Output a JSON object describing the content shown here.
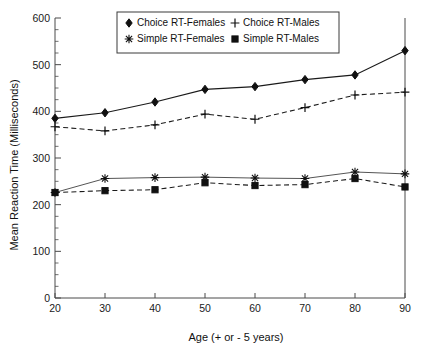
{
  "chart_data": {
    "type": "line",
    "title": "",
    "xlabel": "Age (+ or - 5 years)",
    "ylabel": "Mean Reaction Time (Milliseconds)",
    "x": [
      20,
      30,
      40,
      50,
      60,
      70,
      80,
      90
    ],
    "xtick_labels": [
      "20",
      "30",
      "40",
      "50",
      "60",
      "70",
      "80",
      "90"
    ],
    "ytick_labels": [
      "0",
      "100",
      "200",
      "300",
      "400",
      "500",
      "600"
    ],
    "yticks": [
      0,
      100,
      200,
      300,
      400,
      500,
      600
    ],
    "xlim": [
      20,
      90
    ],
    "ylim": [
      0,
      600
    ],
    "grid": false,
    "legend_position": "top-center",
    "minor_ticks": true,
    "series": [
      {
        "name": "Choice RT-Females",
        "marker": "diamond",
        "line": "solid",
        "values": [
          385,
          397,
          420,
          447,
          453,
          468,
          478,
          530
        ]
      },
      {
        "name": "Choice RT-Males",
        "marker": "plus",
        "line": "dashed",
        "values": [
          367,
          358,
          371,
          394,
          383,
          408,
          435,
          441
        ]
      },
      {
        "name": "Simple RT-Females",
        "marker": "asterisk",
        "line": "solid",
        "values": [
          226,
          256,
          258,
          259,
          257,
          256,
          270,
          266
        ]
      },
      {
        "name": "Simple RT-Males",
        "marker": "square",
        "line": "dashed",
        "values": [
          226,
          230,
          232,
          247,
          241,
          243,
          256,
          238
        ]
      }
    ]
  },
  "legend": {
    "entries": [
      "Choice RT-Females",
      "Choice RT-Males",
      "Simple RT-Females",
      "Simple RT-Males"
    ]
  },
  "colors": {
    "line": "#1a1a1a",
    "axis": "#4a4a4a",
    "background": "#ffffff"
  }
}
